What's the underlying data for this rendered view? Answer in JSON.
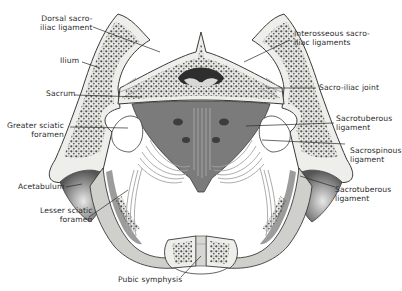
{
  "figure": {
    "colors": {
      "background": "#ffffff",
      "bone_outline": "#3a3a3a",
      "cortical": "#eeeeea",
      "cancellous": "#6a6a6a",
      "ligament": "#9a9a98",
      "shadow": "#4a4a4a",
      "label_text": "#2a2a2a"
    }
  },
  "labels": {
    "dorsal_sacroiliac_ligament": "Dorsal sacro-\niliac ligament",
    "interosseous_sacroiliac_ligaments": "Interosseous sacro-\niliac ligaments",
    "ilium": "Ilium",
    "sacrum": "Sacrum",
    "sacroiliac_joint": "Sacro-iliac joint",
    "greater_sciatic_foramen": "Greater sciatic\nforamen",
    "sacrotuberous_ligament_upper": "Sacrotuberous\nligament",
    "sacrospinous_ligament": "Sacrospinous\nligament",
    "acetabulum": "Acetabulum",
    "sacrotuberous_ligament_lower": "Sacrotuberous\nligament",
    "lesser_sciatic_foramen": "Lesser sciatic\nforamen",
    "pubic_symphysis": "Pubic symphysis"
  }
}
